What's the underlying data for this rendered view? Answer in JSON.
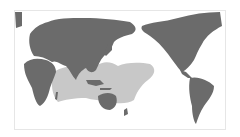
{
  "map": {
    "projection": "pacific-centered world",
    "colors": {
      "background": "#ffffff",
      "land": "#6b6b6b",
      "range": "#c8c8c8",
      "frame": "#e6e6e6"
    },
    "highlighted_region": "Indo-Pacific range (Indian Ocean to central Pacific)"
  }
}
